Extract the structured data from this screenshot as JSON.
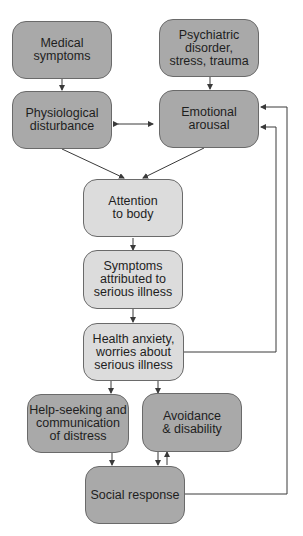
{
  "diagram": {
    "nodes": {
      "medical": "Medical symptoms",
      "psychiatric": "Psychiatric disorder, stress, trauma",
      "physiological": "Physiological disturbance",
      "emotional": "Emotional arousal",
      "attention": "Attention to body",
      "attributed": "Symptoms attributed to serious illness",
      "anxiety": "Health anxiety, worries about serious illness",
      "helpseeking": "Help-seeking and communication of distress",
      "avoidance": "Avoidance & disability",
      "social": "Social response"
    },
    "lines": {
      "medical_1": "Medical",
      "medical_2": "symptoms",
      "psych_1": "Psychiatric disorder,",
      "psych_2": "stress, trauma",
      "phys_1": "Physiological",
      "phys_2": "disturbance",
      "emo_1": "Emotional",
      "emo_2": "arousal",
      "att_1": "Attention",
      "att_2": "to body",
      "attr_1": "Symptoms",
      "attr_2": "attributed to",
      "attr_3": "serious illness",
      "anx_1": "Health anxiety,",
      "anx_2": "worries about",
      "anx_3": "serious illness",
      "help_1": "Help-seeking and",
      "help_2": "communication",
      "help_3": "of distress",
      "avoid_1": "Avoidance",
      "avoid_2": "& disability",
      "social_1": "Social response"
    },
    "colors": {
      "dark_box": "#a9a9a9",
      "light_box": "#dcdcdc",
      "line": "#3a3a3a"
    }
  }
}
